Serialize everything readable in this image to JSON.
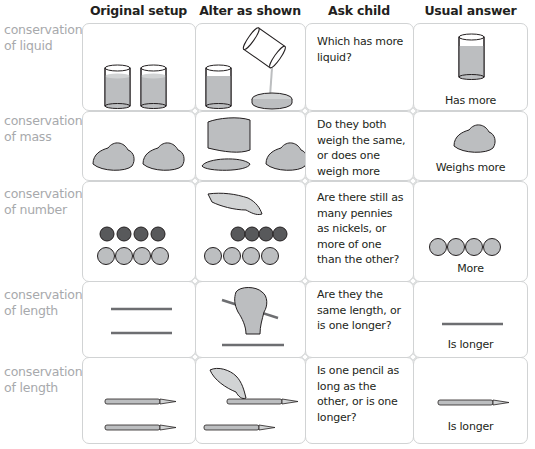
{
  "headers": [
    "Original setup",
    "Alter as shown",
    "Ask child",
    "Usual answer"
  ],
  "rows": [
    {
      "label_line1": "conservation",
      "label_line2": "of liquid",
      "question": "Which has more liquid?",
      "answer": "Has more",
      "original": "two-equal-glasses-of-liquid",
      "altered": "glass-and-liquid-poured-into-wide-dish",
      "usual": "glass"
    },
    {
      "label_line1": "conservation",
      "label_line2": "of mass",
      "question": "Do they both weigh the same, or does one weigh more than the other?",
      "answer": "Weighs more",
      "original": "two-equal-clay-balls",
      "altered": "hand-flattening-one-clay-ball",
      "usual": "clay-ball"
    },
    {
      "label_line1": "conservation",
      "label_line2": "of number",
      "question": "Are there still as many pennies as nickels, or more of one than the other?",
      "answer": "More",
      "original": "4-pennies-above-4-nickels-aligned",
      "altered": "pennies-pushed-together-by-finger",
      "usual": "4-nickels"
    },
    {
      "label_line1": "conservation",
      "label_line2": "of length",
      "question": "Are they the same length, or is one longer?",
      "answer": "Is longer",
      "original": "two-equal-sticks",
      "altered": "hand-tilting-one-stick",
      "usual": "stick"
    },
    {
      "label_line1": "conservation",
      "label_line2": "of length",
      "question": "Is one pencil as long as the other, or is one longer?",
      "answer": "Is longer",
      "original": "two-aligned-pencils",
      "altered": "finger-sliding-one-pencil",
      "usual": "pencil"
    }
  ],
  "colors": {
    "border": "#d1d3d4",
    "label": "#a7a9ac",
    "fill": "#bcbec0",
    "dark": "#58595b",
    "text": "#231f20"
  }
}
